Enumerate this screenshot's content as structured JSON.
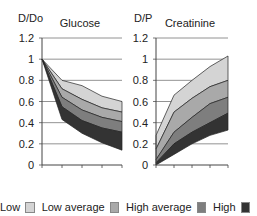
{
  "chart_data": [
    {
      "type": "area",
      "title": "Glucose",
      "ylabel": "D/Do",
      "xlabel": "",
      "ylim": [
        0,
        1.2
      ],
      "yticks": [
        "0",
        "0.2",
        "0.4",
        "0.6",
        "0.8",
        "1",
        "1.2"
      ],
      "x": [
        0,
        1,
        2,
        3,
        4
      ],
      "grid": true,
      "boundaries": [
        {
          "name": "upper",
          "values": [
            1.0,
            0.8,
            0.75,
            0.65,
            0.6
          ]
        },
        {
          "name": "b2",
          "values": [
            1.0,
            0.72,
            0.62,
            0.54,
            0.5
          ]
        },
        {
          "name": "b3",
          "values": [
            1.0,
            0.64,
            0.52,
            0.45,
            0.41
          ]
        },
        {
          "name": "b4",
          "values": [
            1.0,
            0.55,
            0.42,
            0.35,
            0.31
          ]
        },
        {
          "name": "lower",
          "values": [
            1.0,
            0.43,
            0.3,
            0.21,
            0.14
          ]
        }
      ]
    },
    {
      "type": "area",
      "title": "Creatinine",
      "ylabel": "D/P",
      "xlabel": "",
      "ylim": [
        0,
        1.2
      ],
      "yticks": [
        "0",
        "0.2",
        "0.4",
        "0.6",
        "0.8",
        "1",
        "1.2"
      ],
      "x": [
        0,
        1,
        2,
        3,
        4
      ],
      "grid": true,
      "boundaries": [
        {
          "name": "lower",
          "values": [
            0.0,
            0.1,
            0.2,
            0.28,
            0.33
          ]
        },
        {
          "name": "b2",
          "values": [
            0.02,
            0.2,
            0.31,
            0.4,
            0.49
          ]
        },
        {
          "name": "b3",
          "values": [
            0.05,
            0.31,
            0.45,
            0.58,
            0.64
          ]
        },
        {
          "name": "b4",
          "values": [
            0.15,
            0.5,
            0.63,
            0.74,
            0.8
          ]
        },
        {
          "name": "upper",
          "values": [
            0.28,
            0.66,
            0.8,
            0.93,
            1.03
          ]
        }
      ]
    }
  ],
  "legend": {
    "position": "bottom",
    "entries": [
      {
        "label": "Low",
        "color": "#d4d4d4"
      },
      {
        "label": "Low average",
        "color": "#a9a9a9"
      },
      {
        "label": "High average",
        "color": "#7e7e7e"
      },
      {
        "label": "High",
        "color": "#333333"
      }
    ]
  }
}
